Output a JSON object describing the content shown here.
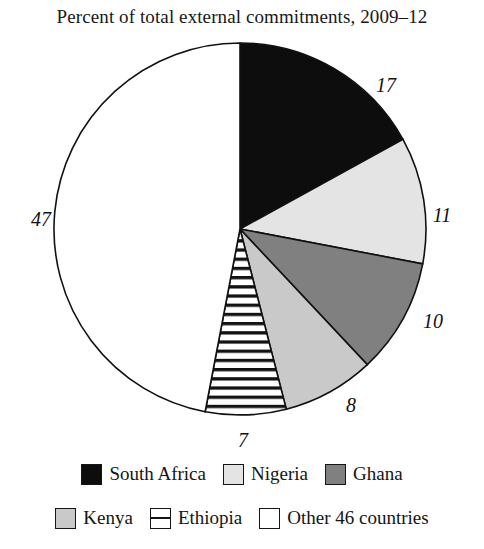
{
  "chart_data": {
    "type": "pie",
    "title": "Percent of total external commitments, 2009–12",
    "xlabel": "",
    "ylabel": "",
    "unit": "percent",
    "start_angle_deg": 0,
    "direction": "clockwise",
    "legend_position": "bottom",
    "grid": false,
    "categories": [
      "South Africa",
      "Nigeria",
      "Ghana",
      "Kenya",
      "Ethiopia",
      "Other 46 countries"
    ],
    "values": [
      17,
      11,
      10,
      8,
      7,
      47
    ],
    "labels": [
      "17",
      "11",
      "10",
      "8",
      "7",
      "47"
    ],
    "slices": [
      {
        "name": "South Africa",
        "value": 17,
        "label": "17",
        "fill": "#0d0d0d",
        "pattern": "solid",
        "stroke": "#111111",
        "label_x": 386,
        "label_y": 85
      },
      {
        "name": "Nigeria",
        "value": 11,
        "label": "11",
        "fill": "#e4e4e4",
        "pattern": "solid",
        "stroke": "#111111",
        "label_x": 442,
        "label_y": 215
      },
      {
        "name": "Ghana",
        "value": 10,
        "label": "10",
        "fill": "#808080",
        "pattern": "solid",
        "stroke": "#111111",
        "label_x": 433,
        "label_y": 321
      },
      {
        "name": "Kenya",
        "value": 8,
        "label": "8",
        "fill": "#c9c9c9",
        "pattern": "solid",
        "stroke": "#111111",
        "label_x": 351,
        "label_y": 405
      },
      {
        "name": "Ethiopia",
        "value": 7,
        "label": "7",
        "fill": "#ffffff",
        "pattern": "horizontal-stripes",
        "stroke": "#111111",
        "label_x": 243,
        "label_y": 440
      },
      {
        "name": "Other 46 countries",
        "value": 47,
        "label": "47",
        "fill": "#ffffff",
        "pattern": "solid",
        "stroke": "#111111",
        "label_x": 41,
        "label_y": 219
      }
    ]
  },
  "legend": {
    "rows": [
      [
        {
          "label": "South Africa",
          "swatch": "black",
          "fill": "#0d0d0d",
          "pattern": "solid"
        },
        {
          "label": "Nigeria",
          "swatch": "light-gray",
          "fill": "#e4e4e4",
          "pattern": "solid"
        },
        {
          "label": "Ghana",
          "swatch": "mid-gray",
          "fill": "#808080",
          "pattern": "solid"
        }
      ],
      [
        {
          "label": "Kenya",
          "swatch": "gray",
          "fill": "#c9c9c9",
          "pattern": "solid"
        },
        {
          "label": "Ethiopia",
          "swatch": "striped",
          "fill": "#ffffff",
          "pattern": "horizontal-stripes"
        },
        {
          "label": "Other 46 countries",
          "swatch": "white",
          "fill": "#ffffff",
          "pattern": "solid"
        }
      ]
    ]
  },
  "geometry": {
    "center_x": 240,
    "center_y": 229,
    "radius": 186
  }
}
